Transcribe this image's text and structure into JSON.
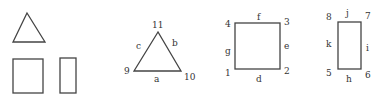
{
  "diagram": {
    "stroke_color": "#444444",
    "label_color": "#333333",
    "plain_shapes": {
      "triangle": {
        "points": [
          [
            27,
            13
          ],
          [
            13,
            42
          ],
          [
            45,
            42
          ]
        ]
      },
      "square": {
        "x": 13,
        "y": 59,
        "w": 30,
        "h": 34
      },
      "rectangle": {
        "x": 60,
        "y": 58,
        "w": 16,
        "h": 35
      }
    },
    "labeled_triangle": {
      "vertices": {
        "top": "11",
        "left": "9",
        "right": "10"
      },
      "edges": {
        "left": "c",
        "right": "b",
        "bottom": "a"
      }
    },
    "labeled_square": {
      "vertices": {
        "top_left": "4",
        "top_right": "3",
        "bottom_left": "1",
        "bottom_right": "2"
      },
      "edges": {
        "top": "f",
        "right": "e",
        "left": "g",
        "bottom": "d"
      }
    },
    "labeled_rectangle": {
      "vertices": {
        "top_left": "8",
        "top_right": "7",
        "bottom_left": "5",
        "bottom_right": "6"
      },
      "edges": {
        "top": "j",
        "right": "i",
        "left": "k",
        "bottom": "h"
      }
    }
  }
}
